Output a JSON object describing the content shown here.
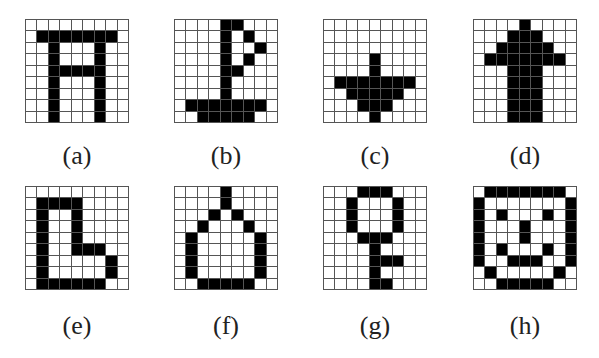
{
  "figure": {
    "colors": {
      "filled": "#000000",
      "empty": "#ffffff",
      "grid_line": "#555555"
    },
    "grid_size": {
      "rows": 9,
      "cols": 9
    },
    "panels": [
      {
        "label": "(a)",
        "pattern": [
          "000000000",
          "011111110",
          "001000100",
          "001000100",
          "001111100",
          "001000100",
          "001000100",
          "001000100",
          "001000100"
        ]
      },
      {
        "label": "(b)",
        "pattern": [
          "000011000",
          "000010100",
          "000010010",
          "000010100",
          "000011000",
          "000010000",
          "000010000",
          "011111110",
          "001111100"
        ]
      },
      {
        "label": "(c)",
        "pattern": [
          "000000000",
          "000000000",
          "000000000",
          "000010000",
          "000010000",
          "011111110",
          "001111100",
          "000111000",
          "000010000"
        ]
      },
      {
        "label": "(d)",
        "pattern": [
          "000010000",
          "000111000",
          "001111100",
          "011111110",
          "000111000",
          "000111000",
          "000111000",
          "000111000",
          "000111000"
        ]
      },
      {
        "label": "(e)",
        "pattern": [
          "000000000",
          "011110000",
          "010010000",
          "010010000",
          "010010000",
          "010011100",
          "010000010",
          "010000010",
          "011111100"
        ]
      },
      {
        "label": "(f)",
        "pattern": [
          "000010000",
          "000010000",
          "000101000",
          "001000100",
          "010000010",
          "010000010",
          "010000010",
          "010000010",
          "001111100"
        ]
      },
      {
        "label": "(g)",
        "pattern": [
          "000111000",
          "001000100",
          "001000100",
          "001000100",
          "000111000",
          "000010000",
          "000011100",
          "000010000",
          "000011000"
        ]
      },
      {
        "label": "(h)",
        "pattern": [
          "011111110",
          "100000001",
          "101000101",
          "100010001",
          "100010001",
          "101000101",
          "100111001",
          "010000010",
          "001111100"
        ]
      }
    ]
  }
}
